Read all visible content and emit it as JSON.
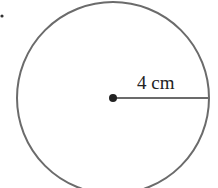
{
  "diagram": {
    "type": "circle",
    "radius_label": "4 cm",
    "colors": {
      "stroke": "#6b6b6b",
      "center_dot": "#222222",
      "text": "#222222"
    }
  }
}
